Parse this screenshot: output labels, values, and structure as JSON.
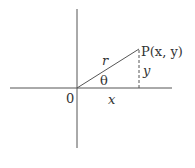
{
  "diagram": {
    "type": "polar-coordinates-triangle",
    "colors": {
      "line": "#555555",
      "text": "#333333",
      "background": "#ffffff"
    },
    "labels": {
      "origin": "0",
      "point": "P(x, y)",
      "radius": "r",
      "angle": "θ",
      "adjacent": "x",
      "opposite": "y"
    },
    "geometry": {
      "origin": [
        77,
        88
      ],
      "point_P": [
        139,
        49
      ],
      "x_axis": {
        "from": [
          10,
          88
        ],
        "to": [
          172,
          88
        ]
      },
      "y_axis": {
        "from": [
          77,
          9
        ],
        "to": [
          77,
          148
        ]
      },
      "dashed_vertical": {
        "from": [
          139,
          49
        ],
        "to": [
          139,
          88
        ]
      }
    }
  }
}
